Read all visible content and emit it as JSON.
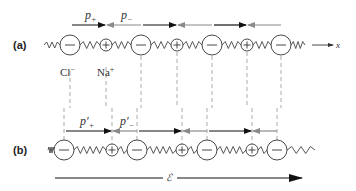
{
  "panels": {
    "a": {
      "label": "(a)",
      "axis_label": "x",
      "ion_labels": {
        "anion": "Cl",
        "anion_sup": "−",
        "cation": "Na",
        "cation_sup": "+"
      },
      "dipole_labels": {
        "plus": "p",
        "plus_sub": "+",
        "minus": "p",
        "minus_sub": "−"
      },
      "ions": [
        "-",
        "+",
        "-",
        "+",
        "-",
        "+",
        "-"
      ]
    },
    "b": {
      "label": "(b)",
      "dipole_labels": {
        "plus": "p′",
        "plus_sub": "+",
        "minus": "p′",
        "minus_sub": "−"
      },
      "ions": [
        "-",
        "+",
        "-",
        "+",
        "-",
        "+",
        "-"
      ],
      "field_label": "ℰ"
    }
  },
  "colors": {
    "positive_dipole": "#111111",
    "negative_dipole": "#8a8a8a",
    "line": "#333333"
  }
}
